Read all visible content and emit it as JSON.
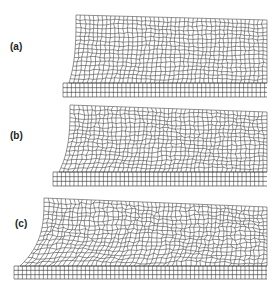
{
  "figure": {
    "panels": [
      {
        "label": "(a)",
        "description": "finite element mesh, initial deformation"
      },
      {
        "label": "(b)",
        "description": "finite element mesh, intermediate deformation"
      },
      {
        "label": "(c)",
        "description": "finite element mesh, large deformation with distorted elements"
      }
    ],
    "colors": {
      "mesh": "#2a2a2a",
      "background": "#ffffff"
    }
  }
}
